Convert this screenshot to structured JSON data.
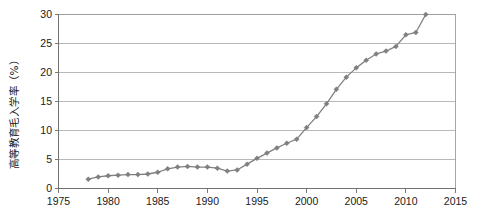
{
  "chart_data": {
    "type": "line",
    "title": "",
    "xlabel": "",
    "ylabel": "高等教育毛入学率（%）",
    "xlim": [
      1975,
      2015
    ],
    "ylim": [
      0,
      30
    ],
    "grid": true,
    "legend": false,
    "marker": "diamond",
    "series_color": "#808080",
    "gridline_color": "#a6a6a6",
    "axis_color": "#6d6d6d",
    "x_ticks": [
      "1975",
      "1980",
      "1985",
      "1990",
      "1995",
      "2000",
      "2005",
      "2010",
      "2015"
    ],
    "y_ticks": [
      "0",
      "5",
      "10",
      "15",
      "20",
      "25",
      "30"
    ],
    "x": [
      1978,
      1979,
      1980,
      1981,
      1982,
      1983,
      1984,
      1985,
      1986,
      1987,
      1988,
      1989,
      1990,
      1991,
      1992,
      1993,
      1994,
      1995,
      1996,
      1997,
      1998,
      1999,
      2000,
      2001,
      2002,
      2003,
      2004,
      2005,
      2006,
      2007,
      2008,
      2009,
      2010,
      2011,
      2012
    ],
    "values": [
      1.6,
      2.0,
      2.2,
      2.3,
      2.4,
      2.4,
      2.5,
      2.8,
      3.4,
      3.7,
      3.8,
      3.7,
      3.7,
      3.5,
      3.0,
      3.2,
      4.2,
      5.2,
      6.1,
      7.0,
      7.8,
      8.5,
      10.5,
      12.4,
      14.6,
      17.1,
      19.2,
      20.8,
      22.1,
      23.2,
      23.7,
      24.5,
      26.5,
      26.9,
      30.0
    ]
  }
}
